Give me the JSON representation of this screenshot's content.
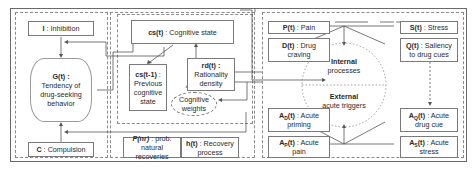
{
  "left": {
    "inhibition": {
      "sym": "I",
      "sep": " : ",
      "label": "Inhibition"
    },
    "tendency": {
      "sym": "G(t) :",
      "line1": "Tendency of",
      "line2": "drug-seeking",
      "line3": "behavior"
    },
    "compulsion": {
      "sym": "C",
      "sep": " : ",
      "label": "Compulsion"
    }
  },
  "middle": {
    "cognitive_state": {
      "sym": "cs(t)",
      "sep": " : ",
      "label": "Cognitive state"
    },
    "previous_state": {
      "sym": "cs(t-1)",
      "sep": " :",
      "line1": "Previous",
      "line2": "cognitive",
      "line3": "state"
    },
    "rationality": {
      "sym": "rd(t) :",
      "line1": "Rationality",
      "line2": "density"
    },
    "weights": {
      "line1": "Cognitive",
      "line2": "weights"
    },
    "natural_recoveries": {
      "sym": "P(nr)",
      "sep": " : prob.",
      "line2": "natural recoveries"
    },
    "recovery": {
      "sym": "h(t)",
      "sep": " : Recovery",
      "line2": "process"
    }
  },
  "right": {
    "pain": {
      "sym": "P(t)",
      "sep": " : ",
      "label": "Pain"
    },
    "craving": {
      "sym": "D(t)",
      "sep": " : Drug",
      "line2": "craving"
    },
    "stress": {
      "sym": "S(t)",
      "sep": " : ",
      "label": "Stress"
    },
    "saliency": {
      "sym": "Q(t)",
      "sep": " : Saliency",
      "line2": "to drug cues"
    },
    "internal": {
      "bold": "Internal",
      "text": "processes"
    },
    "external": {
      "bold": "External",
      "text": "acute triggers"
    },
    "acute_priming": {
      "sym": "A",
      "sub": "D",
      "sym2": "(t)",
      "sep": " : Acute",
      "line2": "priming"
    },
    "acute_pain": {
      "sym": "A",
      "sub": "P",
      "sym2": "(t)",
      "sep": " : Acute",
      "line2": "pain"
    },
    "acute_drug_cue": {
      "sym": "A",
      "sub": "Q",
      "sym2": "(t)",
      "sep": " : Acute",
      "line2": "drug cue"
    },
    "acute_stress": {
      "sym": "A",
      "sub": "S",
      "sym2": "(t)",
      "sep": " : Acute",
      "line2": "stress"
    }
  }
}
